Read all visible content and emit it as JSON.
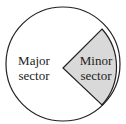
{
  "diagram": {
    "major_label_line1": "Major",
    "major_label_line2": "sector",
    "minor_label_line1": "Minor",
    "minor_label_line2": "sector",
    "colors": {
      "minor_fill": "#d9d9d9",
      "major_fill": "#ffffff",
      "stroke": "#222222"
    }
  }
}
